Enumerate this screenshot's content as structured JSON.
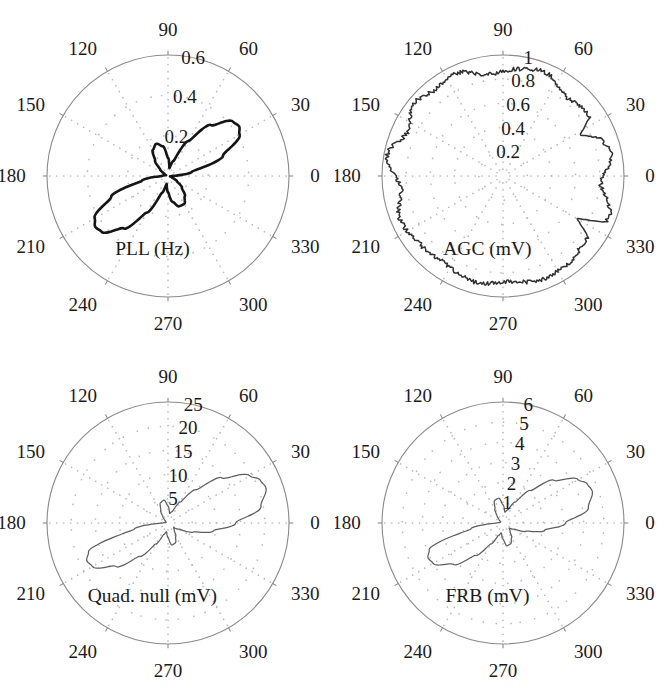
{
  "figure": {
    "layout": "2x2 grid of polar plots",
    "background_color": "#ffffff",
    "axis_color": "#8a8a8a",
    "grid_color": "#b9b9b9"
  },
  "common": {
    "angle_labels": [
      "0",
      "30",
      "60",
      "90",
      "120",
      "150",
      "180",
      "210",
      "240",
      "270",
      "300",
      "330"
    ],
    "angle_values": [
      0,
      30,
      60,
      90,
      120,
      150,
      180,
      210,
      240,
      270,
      300,
      330
    ]
  },
  "panels": [
    {
      "id": "pll",
      "title": "PLL (Hz)",
      "radial_labels": [
        "0.2",
        "0.4",
        "0.6"
      ],
      "radial_values": [
        0.2,
        0.4,
        0.6
      ],
      "rmax": 0.6,
      "trace_color": "#151515",
      "trace_weight": "heavy"
    },
    {
      "id": "agc",
      "title": "AGC (mV)",
      "radial_labels": [
        "0.2",
        "0.4",
        "0.6",
        "0.8",
        "1"
      ],
      "radial_values": [
        0.2,
        0.4,
        0.6,
        0.8,
        1
      ],
      "rmax": 1,
      "trace_color": "#303030",
      "trace_weight": "medium"
    },
    {
      "id": "quad-null",
      "title": "Quad. null (mV)",
      "radial_labels": [
        "5",
        "10",
        "15",
        "20",
        "25"
      ],
      "radial_values": [
        5,
        10,
        15,
        20,
        25
      ],
      "rmax": 25,
      "trace_color": "#5e5e5e",
      "trace_weight": "light"
    },
    {
      "id": "frb",
      "title": "FRB (mV)",
      "radial_labels": [
        "1",
        "2",
        "3",
        "4",
        "5",
        "6"
      ],
      "radial_values": [
        1,
        2,
        3,
        4,
        5,
        6
      ],
      "rmax": 6,
      "trace_color": "#5e5e5e",
      "trace_weight": "light"
    }
  ],
  "chart_data": [
    {
      "type": "line",
      "subplot": "top-left",
      "title": "PLL (Hz)",
      "coordinate_system": "polar",
      "theta_unit": "degrees",
      "rlim": [
        0,
        0.6
      ],
      "rticks": [
        0.2,
        0.4,
        0.6
      ],
      "theta_ticks": [
        0,
        30,
        60,
        90,
        120,
        150,
        180,
        210,
        240,
        270,
        300,
        330
      ],
      "grid": true,
      "grid_style": "dotted",
      "description": "Four-lobe antenna-pattern: two large lobes along the 35-215 degree axis and two small lobes along the 110-300 degree axis",
      "theta": [
        0,
        10,
        20,
        30,
        35,
        40,
        50,
        60,
        70,
        80,
        90,
        100,
        110,
        120,
        130,
        140,
        150,
        160,
        170,
        180,
        190,
        200,
        210,
        215,
        220,
        230,
        240,
        250,
        260,
        270,
        280,
        290,
        300,
        310,
        320,
        330,
        340,
        350,
        360
      ],
      "r": [
        0.02,
        0.12,
        0.29,
        0.41,
        0.43,
        0.42,
        0.33,
        0.2,
        0.08,
        0.04,
        0.09,
        0.15,
        0.17,
        0.15,
        0.1,
        0.05,
        0.02,
        0.01,
        0.02,
        0.03,
        0.13,
        0.3,
        0.42,
        0.44,
        0.43,
        0.34,
        0.21,
        0.09,
        0.04,
        0.08,
        0.13,
        0.16,
        0.16,
        0.13,
        0.09,
        0.05,
        0.02,
        0.01,
        0.02
      ]
    },
    {
      "type": "line",
      "subplot": "top-right",
      "title": "AGC (mV)",
      "coordinate_system": "polar",
      "theta_unit": "degrees",
      "rlim": [
        0,
        1
      ],
      "rticks": [
        0.2,
        0.4,
        0.6,
        0.8,
        1
      ],
      "theta_ticks": [
        0,
        30,
        60,
        90,
        120,
        150,
        180,
        210,
        240,
        270,
        300,
        330
      ],
      "grid": true,
      "grid_style": "dotted",
      "description": "Nearly circular noisy trace at roughly 0.85 to 0.92 mV with two inward notches near 150 and 210 degrees",
      "mean_r": 0.89,
      "noise_amplitude": 0.035,
      "notches": [
        {
          "theta": 150,
          "r": 0.7
        },
        {
          "theta": 208,
          "r": 0.72
        }
      ]
    },
    {
      "type": "line",
      "subplot": "bottom-left",
      "title": "Quad. null (mV)",
      "coordinate_system": "polar",
      "theta_unit": "degrees",
      "rlim": [
        0,
        25
      ],
      "rticks": [
        5,
        10,
        15,
        20,
        25
      ],
      "theta_ticks": [
        0,
        30,
        60,
        90,
        120,
        150,
        180,
        210,
        240,
        270,
        300,
        330
      ],
      "grid": true,
      "grid_style": "dotted",
      "description": "Two-lobe pattern with large lobes toward 20 and 200 degrees plus small lobes near 105 and 285 degrees",
      "theta": [
        0,
        10,
        20,
        25,
        30,
        40,
        50,
        60,
        70,
        80,
        90,
        100,
        110,
        120,
        130,
        140,
        150,
        160,
        170,
        180,
        190,
        200,
        205,
        210,
        220,
        230,
        240,
        250,
        260,
        270,
        280,
        290,
        300,
        310,
        320,
        330,
        340,
        350,
        360
      ],
      "r": [
        14.0,
        19.5,
        21.5,
        21.0,
        19.5,
        14.5,
        9.0,
        5.0,
        2.5,
        2.0,
        3.5,
        4.8,
        4.5,
        3.0,
        1.6,
        0.8,
        0.5,
        0.4,
        0.5,
        1.0,
        7.0,
        17.5,
        18.5,
        18.0,
        14.0,
        9.0,
        5.0,
        2.5,
        1.8,
        3.0,
        4.6,
        4.4,
        3.2,
        2.0,
        1.5,
        2.5,
        5.5,
        9.5,
        14.0
      ]
    },
    {
      "type": "line",
      "subplot": "bottom-right",
      "title": "FRB (mV)",
      "coordinate_system": "polar",
      "theta_unit": "degrees",
      "rlim": [
        0,
        6
      ],
      "rticks": [
        1,
        2,
        3,
        4,
        5,
        6
      ],
      "theta_ticks": [
        0,
        30,
        60,
        90,
        120,
        150,
        180,
        210,
        240,
        270,
        300,
        330
      ],
      "grid": true,
      "grid_style": "dotted",
      "description": "Two-lobe pattern with large lobes toward 20 and 200 degrees, smaller lobes near 105 and 285 degrees",
      "theta": [
        0,
        10,
        20,
        25,
        30,
        40,
        50,
        60,
        70,
        80,
        90,
        100,
        110,
        120,
        130,
        140,
        150,
        160,
        170,
        180,
        190,
        200,
        205,
        210,
        220,
        230,
        240,
        250,
        260,
        270,
        280,
        290,
        300,
        310,
        320,
        330,
        340,
        350,
        360
      ],
      "r": [
        3.1,
        4.3,
        4.7,
        4.6,
        4.3,
        3.3,
        2.1,
        1.2,
        0.7,
        0.55,
        0.9,
        1.25,
        1.2,
        0.8,
        0.45,
        0.25,
        0.15,
        0.12,
        0.15,
        0.3,
        1.6,
        3.9,
        4.1,
        4.0,
        3.2,
        2.1,
        1.2,
        0.65,
        0.5,
        0.8,
        1.15,
        1.1,
        0.85,
        0.55,
        0.4,
        0.6,
        1.2,
        2.1,
        3.1
      ]
    }
  ]
}
